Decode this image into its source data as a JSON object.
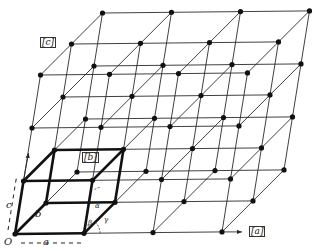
{
  "diagram": {
    "title": "",
    "origin_px": [
      15,
      234
    ],
    "basis_px": {
      "a": [
        69,
        -0.7
      ],
      "b": [
        31,
        -31
      ],
      "c": [
        8.5,
        -53
      ]
    },
    "grid_cells": {
      "a": 3,
      "b": 2,
      "c": 3
    },
    "colors": {
      "line": "#2a2a2a",
      "bold": "#111111",
      "node": "#111111",
      "bg": "#ffffff"
    },
    "labels": {
      "axis_a": "[a]",
      "axis_b": "[b]",
      "axis_c": "[c]",
      "origin": "O",
      "edge_a": "a",
      "edge_b": "b",
      "edge_c": "c",
      "alpha": "α",
      "beta": "β",
      "gamma": "γ"
    },
    "label_positions": {
      "axis_a": [
        249,
        226
      ],
      "axis_b": [
        82,
        152
      ],
      "axis_c": [
        40,
        37
      ],
      "origin": [
        4,
        237
      ],
      "edge_a": [
        43,
        237
      ],
      "edge_b": [
        35,
        209
      ],
      "edge_c": [
        6,
        200
      ],
      "alpha": [
        95,
        203
      ],
      "beta": [
        88,
        220
      ],
      "gamma": [
        104,
        217
      ]
    }
  }
}
